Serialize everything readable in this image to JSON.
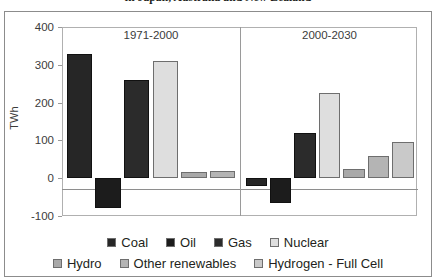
{
  "title": "in Japan, Australia and New Zealand",
  "chart_data": {
    "type": "bar",
    "title": "in Japan, Australia and New Zealand",
    "ylabel": "TWh",
    "xlabel": "",
    "ylim": [
      -100,
      400
    ],
    "yticks": [
      "400",
      "300",
      "200",
      "100",
      "0",
      "-100"
    ],
    "grid": false,
    "legend_position": "bottom",
    "panels": [
      {
        "label": "1971-2000",
        "categories": [
          "Coal",
          "Oil",
          "Gas",
          "Nuclear",
          "Hydro",
          "Other renewables"
        ],
        "values": [
          330,
          -80,
          260,
          310,
          16,
          19
        ]
      },
      {
        "label": "2000-2030",
        "categories": [
          "Coal",
          "Oil",
          "Gas",
          "Nuclear",
          "Hydro",
          "Other renewables",
          "Hydrogen - Full Cell"
        ],
        "values": [
          -22,
          -65,
          120,
          225,
          25,
          60,
          95
        ]
      }
    ],
    "series": [
      {
        "name": "Coal",
        "color": "#262626",
        "values": [
          330,
          -22
        ]
      },
      {
        "name": "Oil",
        "color": "#1c1c1c",
        "values": [
          -80,
          -65
        ]
      },
      {
        "name": "Gas",
        "color": "#2b2b2b",
        "values": [
          260,
          120
        ]
      },
      {
        "name": "Nuclear",
        "color": "#dedede",
        "values": [
          310,
          225
        ]
      },
      {
        "name": "Hydro",
        "color": "#a9a9a9",
        "values": [
          16,
          25
        ]
      },
      {
        "name": "Other renewables",
        "color": "#b4b4b4",
        "values": [
          19,
          60
        ]
      },
      {
        "name": "Hydrogen - Full Cell",
        "color": "#c9c9c9",
        "values": [
          null,
          95
        ]
      }
    ],
    "legend": [
      {
        "label": "Coal",
        "color": "#262626"
      },
      {
        "label": "Oil",
        "color": "#1c1c1c"
      },
      {
        "label": "Gas",
        "color": "#2b2b2b"
      },
      {
        "label": "Nuclear",
        "color": "#dedede"
      },
      {
        "label": "Hydro",
        "color": "#a9a9a9"
      },
      {
        "label": "Other renewables",
        "color": "#b4b4b4"
      },
      {
        "label": "Hydrogen - Full Cell",
        "color": "#c9c9c9"
      }
    ],
    "legend_rows": [
      [
        "Coal",
        "Oil",
        "Gas",
        "Nuclear"
      ],
      [
        "Hydro",
        "Other renewables",
        "Hydrogen - Full Cell"
      ]
    ]
  }
}
